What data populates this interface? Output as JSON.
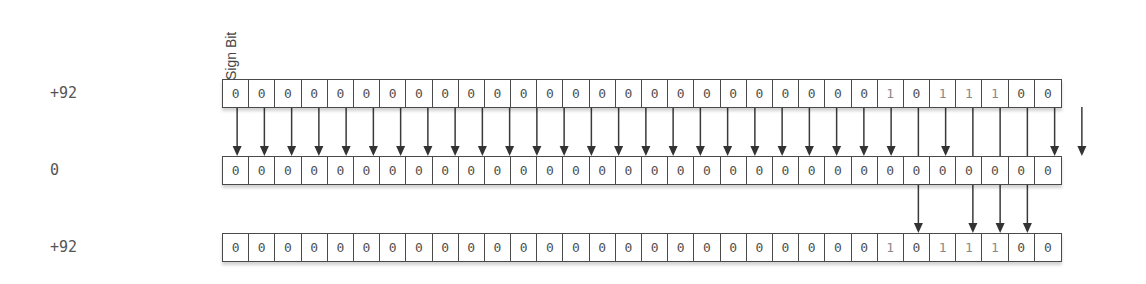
{
  "diagram": {
    "sign_bit_label": "Sign Bit",
    "bit_width": 32,
    "rows": [
      {
        "label": "+92",
        "bits": "00000000000000000000000001011100"
      },
      {
        "label": "0",
        "bits": "00000000000000000000000000000000"
      },
      {
        "label": "+92",
        "bits": "00000000000000000000000001011100"
      }
    ],
    "arrows": {
      "row1_to_row2": "zero bits of row 1 point to corresponding bits of row 2",
      "row1_to_row3": "one bits of row 1 pass behind row 2 and point to corresponding bits of row 3"
    },
    "colors": {
      "zero_digit": "#505050",
      "one_digit": "#8a8a8a",
      "border": "#4a4a4a"
    }
  }
}
